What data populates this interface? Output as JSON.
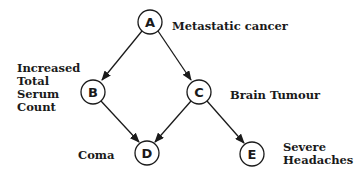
{
  "diagram": {
    "type": "bayesian-network",
    "nodes": [
      {
        "id": "A",
        "label": "A",
        "description": "Metastatic cancer"
      },
      {
        "id": "B",
        "label": "B",
        "description_lines": [
          "Increased",
          "Total",
          "Serum",
          "Count"
        ]
      },
      {
        "id": "C",
        "label": "C",
        "description": "Brain Tumour"
      },
      {
        "id": "D",
        "label": "D",
        "description": "Coma"
      },
      {
        "id": "E",
        "label": "E",
        "description_lines": [
          "Severe",
          "Headaches"
        ]
      }
    ],
    "edges": [
      {
        "from": "A",
        "to": "B"
      },
      {
        "from": "A",
        "to": "C"
      },
      {
        "from": "B",
        "to": "D"
      },
      {
        "from": "C",
        "to": "D"
      },
      {
        "from": "C",
        "to": "E"
      }
    ],
    "colors": {
      "stroke": "#1a1a1a",
      "background": "#ffffff"
    }
  }
}
